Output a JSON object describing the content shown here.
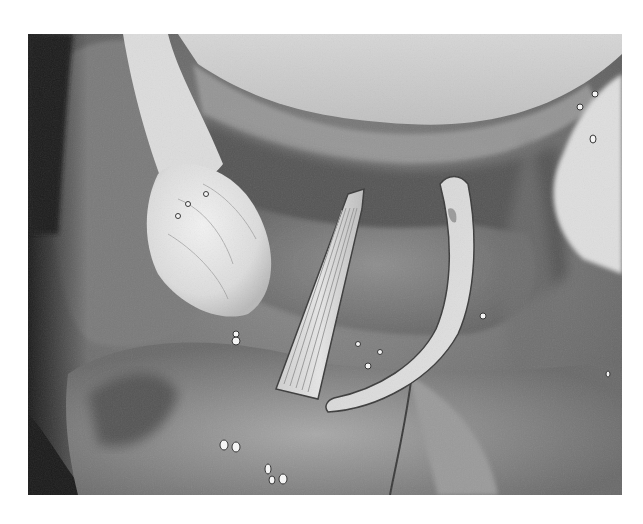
{
  "image": {
    "kind": "grayscale surgical endoscopic photograph",
    "frame": {
      "x": 28,
      "y": 34,
      "width": 594,
      "height": 461
    },
    "background_color": "#ffffff",
    "palette": {
      "dark_shadow": "#1e1e1e",
      "tissue_dark": "#5a5a5a",
      "tissue_mid": "#8a8a8a",
      "tissue_light": "#b4b4b4",
      "highlight": "#eeeeee",
      "instrument": "#d8d8d8"
    },
    "regions": [
      {
        "name": "upper-pale-membrane",
        "position": "top-center"
      },
      {
        "name": "pale-tissue-mass",
        "position": "upper-left"
      },
      {
        "name": "right-pale-tissue",
        "position": "upper-right"
      },
      {
        "name": "ribbed-retractor-blade",
        "position": "center"
      },
      {
        "name": "curved-metal-retractor",
        "position": "center-right"
      },
      {
        "name": "lower-tissue-surface",
        "position": "bottom"
      },
      {
        "name": "dark-left-shadow",
        "position": "left-edge"
      }
    ]
  }
}
